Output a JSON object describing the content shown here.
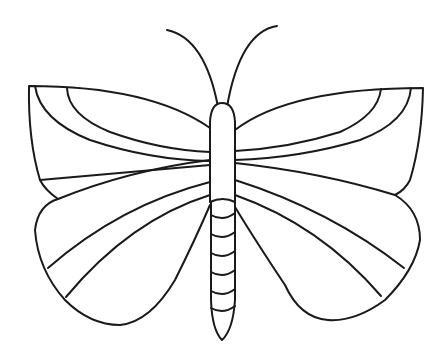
{
  "image": {
    "subject": "butterfly line drawing",
    "background_color": "#ffffff",
    "stroke_color": "#1a1a1a"
  },
  "butterfly": {
    "antennae": 2,
    "wings": [
      "upper-left",
      "upper-right",
      "lower-left",
      "lower-right"
    ],
    "abdomen_segments": 6
  }
}
